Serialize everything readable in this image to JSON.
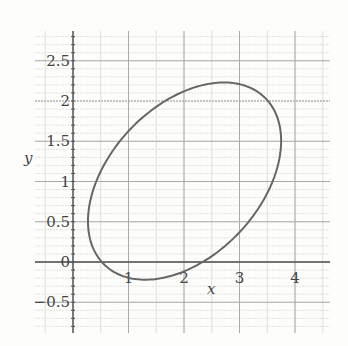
{
  "chart_data": {
    "type": "line",
    "title": "",
    "xlabel": "x",
    "ylabel": "y",
    "xlim": [
      -0.7,
      4.6
    ],
    "ylim": [
      -0.88,
      2.87
    ],
    "grid": true,
    "x_ticks": [
      "1",
      "2",
      "3",
      "4"
    ],
    "x_tick_values": [
      1,
      2,
      3,
      4
    ],
    "y_ticks": [
      "-0.5",
      "0",
      "0.5",
      "1",
      "1.5",
      "2",
      "2.5"
    ],
    "y_tick_values": [
      -0.5,
      0,
      0.5,
      1,
      1.5,
      2,
      2.5
    ],
    "series": [
      {
        "name": "ellipse",
        "shape": "rotated ellipse",
        "center": [
          2.0,
          1.0
        ],
        "extremes": {
          "top": [
            2.88,
            2.23
          ],
          "bottom": [
            1.21,
            -0.22
          ],
          "left": [
            0.27,
            0.46
          ],
          "right": [
            3.75,
            1.39
          ]
        },
        "color": "#666666"
      }
    ]
  },
  "labels": {
    "x_axis": "x",
    "y_axis": "y"
  }
}
